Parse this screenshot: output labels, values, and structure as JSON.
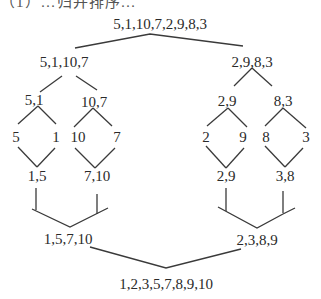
{
  "diagram": {
    "title_cut": "（1）…归并排序…",
    "root": "5,1,10,7,2,9,8,3",
    "level1": {
      "left": "5,1,10,7",
      "right": "2,9,8,3"
    },
    "level2": {
      "ll": "5,1",
      "lr": "10,7",
      "rl": "2,9",
      "rr": "8,3"
    },
    "leaves": [
      "5",
      "1",
      "10",
      "7",
      "2",
      "9",
      "8",
      "3"
    ],
    "merge1": {
      "ll": "1,5",
      "lr": "7,10",
      "rl": "2,9",
      "rr": "3,8"
    },
    "merge2": {
      "left": "1,5,7,10",
      "right": "2,3,8,9"
    },
    "result": "1,2,3,5,7,8,9,10"
  }
}
